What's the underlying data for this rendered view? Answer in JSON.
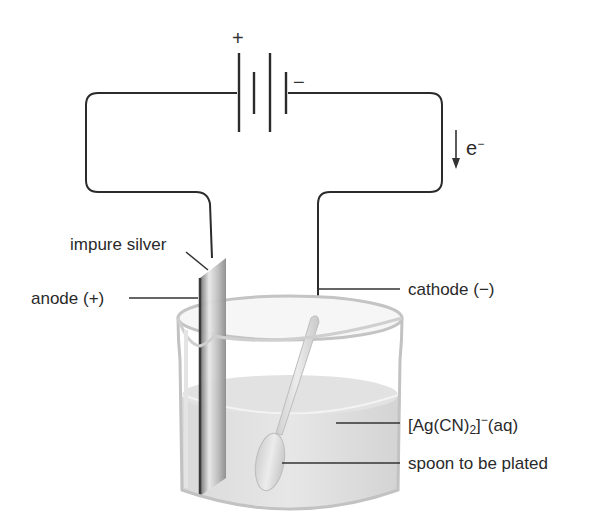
{
  "battery": {
    "positive_symbol": "+",
    "negative_symbol": "−"
  },
  "electron_flow": {
    "label": "e",
    "charge": "−"
  },
  "labels": {
    "impure_silver": "impure silver",
    "anode": "anode (+)",
    "cathode": "cathode (−)",
    "solution_prefix": "[Ag(CN)",
    "solution_sub": "2",
    "solution_bracket": "]",
    "solution_sup": "−",
    "solution_suffix": "(aq)",
    "spoon": "spoon to be plated"
  },
  "colors": {
    "wire": "#2b2b2b",
    "solution": "#d9d9d9",
    "beaker": "#bdbdbd",
    "electrode": "#8a8a8a"
  }
}
